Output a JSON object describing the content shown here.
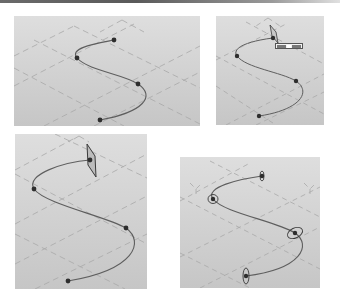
{
  "figure": {
    "colors": {
      "background_top": "#dedede",
      "background_bottom": "#c6c6c6",
      "grid": "#a8a8a8",
      "curve": "#5e5e5e",
      "point": "#2e2e2e",
      "handle": "#3a3a3a"
    }
  },
  "panels": [
    {
      "id": "p1",
      "title": "",
      "points": [
        [
          100,
          24
        ],
        [
          63,
          42
        ],
        [
          124,
          68
        ],
        [
          86,
          104
        ]
      ],
      "handles": "none"
    },
    {
      "id": "p2",
      "title": "",
      "points": [
        [
          57,
          22
        ],
        [
          21,
          40
        ],
        [
          80,
          65
        ],
        [
          43,
          100
        ]
      ],
      "handles": "plane-at-first-point",
      "label_box": {
        "field_1": "草图1",
        "field_2": "草图1"
      }
    },
    {
      "id": "p3",
      "title": "",
      "points": [
        [
          75,
          26
        ],
        [
          19,
          55
        ],
        [
          111,
          94
        ],
        [
          53,
          147
        ]
      ],
      "handles": "plane-at-first-point"
    },
    {
      "id": "p4",
      "title": "",
      "points": [
        [
          82,
          19
        ],
        [
          33,
          42
        ],
        [
          115,
          76
        ],
        [
          66,
          119
        ]
      ],
      "handles": "ellipse-at-each-point"
    }
  ]
}
